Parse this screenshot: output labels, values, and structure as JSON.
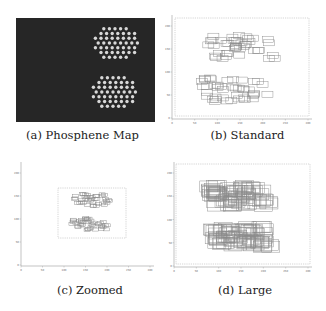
{
  "figure": {
    "panels": [
      {
        "id": "a",
        "caption": "(a) Phosphene Map",
        "type": "image",
        "background": "#262626",
        "dot_color": "#d8d8d8",
        "box": {
          "x": 16,
          "y": 18,
          "w": 139,
          "h": 104
        },
        "clusters": [
          {
            "cx": 115,
            "cy": 43,
            "rows": 7,
            "cols": 8,
            "spacing": 5.6
          },
          {
            "cx": 113,
            "cy": 92,
            "rows": 7,
            "cols": 8,
            "spacing": 5.6
          }
        ],
        "caption_pos": {
          "x": 20,
          "y": 128,
          "w": 125
        }
      },
      {
        "id": "b",
        "caption": "(b) Standard",
        "type": "rect-plot",
        "box": {
          "x": 172,
          "y": 15,
          "w": 140,
          "h": 104
        },
        "inner_dashed": {
          "x": 175,
          "y": 18,
          "w": 134,
          "h": 98
        },
        "xticks": [
          "0",
          "50",
          "100",
          "150",
          "200",
          "250",
          "300"
        ],
        "yticks": [
          "0",
          "50",
          "100",
          "150",
          "200"
        ],
        "clusters": [
          {
            "cx": 240,
            "cy": 47,
            "n": 42,
            "rw": 11,
            "rh": 6,
            "spread_x": 34,
            "spread_y": 12
          },
          {
            "cx": 238,
            "cy": 90,
            "n": 42,
            "rw": 11,
            "rh": 6,
            "spread_x": 34,
            "spread_y": 12
          }
        ],
        "caption_pos": {
          "x": 190,
          "y": 128,
          "w": 115
        }
      },
      {
        "id": "c",
        "caption": "(c) Zoomed",
        "type": "rect-plot",
        "box": {
          "x": 21,
          "y": 162,
          "w": 133,
          "h": 104
        },
        "inner_dashed": {
          "x": 58,
          "y": 188,
          "w": 68,
          "h": 50
        },
        "xticks": [
          "0",
          "50",
          "100",
          "150",
          "200",
          "250",
          "300"
        ],
        "yticks": [
          "0",
          "50",
          "100",
          "150",
          "200"
        ],
        "clusters": [
          {
            "cx": 92,
            "cy": 200,
            "n": 40,
            "rw": 6,
            "rh": 3,
            "spread_x": 18,
            "spread_y": 6
          },
          {
            "cx": 90,
            "cy": 224,
            "n": 40,
            "rw": 6,
            "rh": 3,
            "spread_x": 18,
            "spread_y": 6
          }
        ],
        "caption_pos": {
          "x": 40,
          "y": 283,
          "w": 100
        }
      },
      {
        "id": "d",
        "caption": "(d) Large",
        "type": "rect-plot",
        "box": {
          "x": 174,
          "y": 162,
          "w": 138,
          "h": 105
        },
        "inner_dashed": {
          "x": 176,
          "y": 164,
          "w": 134,
          "h": 100
        },
        "xticks": [
          "0",
          "50",
          "100",
          "150",
          "200",
          "250",
          "300"
        ],
        "yticks": [
          "0",
          "50",
          "100",
          "150",
          "200"
        ],
        "clusters": [
          {
            "cx": 240,
            "cy": 196,
            "n": 70,
            "rw": 18,
            "rh": 11,
            "spread_x": 28,
            "spread_y": 10
          },
          {
            "cx": 240,
            "cy": 237,
            "n": 70,
            "rw": 18,
            "rh": 11,
            "spread_x": 28,
            "spread_y": 10
          }
        ],
        "caption_pos": {
          "x": 190,
          "y": 283,
          "w": 110
        }
      }
    ],
    "line_color": "#8a8a8a",
    "axis_color": "#9a9a9a"
  }
}
